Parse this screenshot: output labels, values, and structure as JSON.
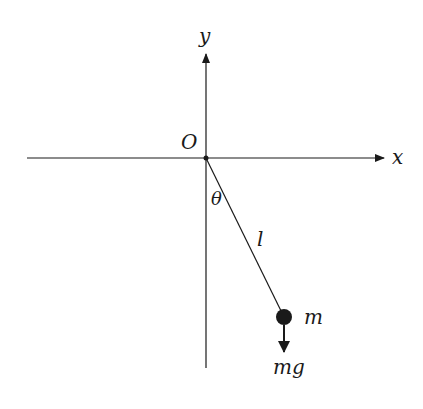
{
  "diagram": {
    "type": "simple-pendulum",
    "colors": {
      "stroke": "#1a1a1a",
      "background": "#ffffff"
    },
    "axes": {
      "x_label": "x",
      "y_label": "y",
      "origin_label": "O"
    },
    "pendulum": {
      "angle_label": "θ",
      "length_label": "l",
      "mass_label": "m",
      "force_label": "mg"
    }
  }
}
